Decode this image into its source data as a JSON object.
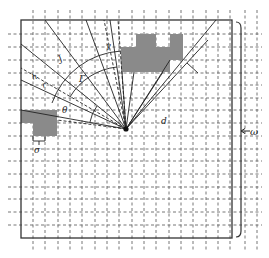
{
  "diagram": {
    "type": "ray-casting field-of-view grid",
    "colors": {
      "background": "#ffffff",
      "grid": "#555555",
      "frame": "#333333",
      "obstacle": "#8a8a8a",
      "ray": "#222222"
    },
    "grid": {
      "style": "dashed",
      "x_lines": [
        33,
        45,
        58,
        70,
        82,
        95,
        107,
        119,
        132,
        144,
        156,
        169,
        181,
        193,
        206,
        218,
        230,
        245,
        257
      ],
      "y_lines": [
        34,
        47,
        60,
        73,
        85,
        98,
        110,
        123,
        136,
        149,
        161,
        174,
        187,
        199,
        212,
        225
      ]
    },
    "frame": {
      "x": 21,
      "y": 20,
      "width": 211,
      "height": 218
    },
    "origin": {
      "x": 126,
      "y": 129
    },
    "obstacles": [
      {
        "x": 136,
        "y": 34,
        "w": 20,
        "h": 13
      },
      {
        "x": 170,
        "y": 34,
        "w": 13,
        "h": 26
      },
      {
        "x": 121,
        "y": 47,
        "w": 62,
        "h": 13
      },
      {
        "x": 121,
        "y": 60,
        "w": 49,
        "h": 12
      },
      {
        "x": 21,
        "y": 110,
        "w": 12,
        "h": 13
      },
      {
        "x": 33,
        "y": 110,
        "w": 24,
        "h": 26
      }
    ],
    "labels": {
      "J": "J",
      "gamma": "γ",
      "h": "h",
      "r": "r",
      "Gamma": "Γ",
      "theta": "θ",
      "d": "d",
      "sigma": "σ",
      "omega": "ω"
    }
  }
}
